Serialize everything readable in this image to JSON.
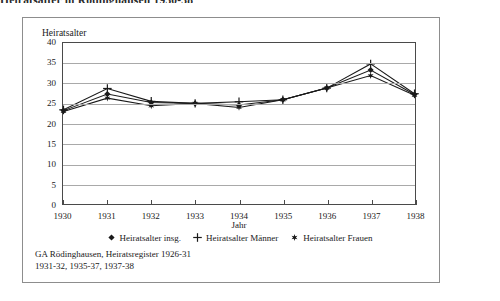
{
  "page": {
    "heading": "Heiratsalter in Rödinghausen 1930-38"
  },
  "figure": {
    "y_axis_title": "Heiratsalter",
    "x_axis_title": "Jahr",
    "source_note": "GA Rödinghausen, Heiratsregister 1926-31\n1931-32, 1935-37, 1937-38"
  },
  "legend": {
    "items": [
      {
        "label": "Heiratsalter insg.",
        "marker": "diamond-marker-icon",
        "color": "#1a1a1a"
      },
      {
        "label": "Heiratsalter Männer",
        "marker": "plus-marker-icon",
        "color": "#1a1a1a"
      },
      {
        "label": "Heiratsalter Frauen",
        "marker": "star-marker-icon",
        "color": "#1a1a1a"
      }
    ]
  },
  "chart_data": {
    "type": "line",
    "title": "Heiratsalter in Rödinghausen 1930-38",
    "xlabel": "Jahr",
    "ylabel": "Heiratsalter",
    "ylim": [
      0,
      40
    ],
    "yticks": [
      0,
      5,
      10,
      15,
      20,
      25,
      30,
      35,
      40
    ],
    "grid": true,
    "legend_position": "bottom",
    "categories": [
      "1930",
      "1931",
      "1932",
      "1933",
      "1934",
      "1935",
      "1936",
      "1937",
      "1938"
    ],
    "series": [
      {
        "name": "Heiratsalter insg.",
        "marker": "diamond",
        "values": [
          23.2,
          27.3,
          25.2,
          25.0,
          24.6,
          25.9,
          28.8,
          33.3,
          27.2
        ]
      },
      {
        "name": "Heiratsalter Männer",
        "marker": "plus",
        "values": [
          23.4,
          28.7,
          25.5,
          25.0,
          25.4,
          25.9,
          28.8,
          34.8,
          27.4
        ]
      },
      {
        "name": "Heiratsalter Frauen",
        "marker": "star",
        "values": [
          23.0,
          26.3,
          24.4,
          25.0,
          24.0,
          25.9,
          28.8,
          31.9,
          27.0
        ]
      }
    ]
  }
}
